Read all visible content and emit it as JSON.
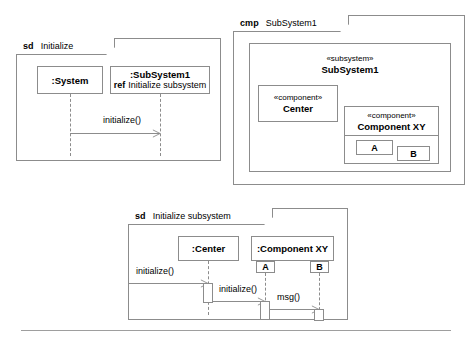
{
  "page": {
    "background_color": "#ffffff",
    "line_color": "#8c8c8c",
    "rule_color": "#9e9e9e"
  },
  "diagrams": {
    "sd_initialize": {
      "frame_kind": "sd",
      "frame_name": "Initialize",
      "lifelines": [
        {
          "name": ":System"
        },
        {
          "name": ":SubSystem1",
          "ref_keyword": "ref",
          "ref_text": "Initialize subsystem"
        }
      ],
      "messages": [
        {
          "label": "initialize()",
          "from": ":System",
          "to": ":SubSystem1"
        }
      ]
    },
    "cmp_subsystem1": {
      "frame_kind": "cmp",
      "frame_name": "SubSystem1",
      "subsystem": {
        "stereotype": "«subsystem»",
        "name": "SubSystem1"
      },
      "components": [
        {
          "stereotype": "«component»",
          "name": "Center"
        },
        {
          "stereotype": "«component»",
          "name": "Component XY",
          "parts": [
            "A",
            "B"
          ]
        }
      ]
    },
    "sd_initialize_subsystem": {
      "frame_kind": "sd",
      "frame_name": "Initialize subsystem",
      "lifelines": [
        {
          "name": ":Center"
        },
        {
          "name": ":Component XY",
          "ports": [
            "A",
            "B"
          ]
        }
      ],
      "messages": [
        {
          "label": "initialize()",
          "from": "gate",
          "to": ":Center"
        },
        {
          "label": "initialize()",
          "from": ":Center",
          "to": "A"
        },
        {
          "label": "msg()",
          "from": "A",
          "to": "B"
        }
      ]
    }
  }
}
